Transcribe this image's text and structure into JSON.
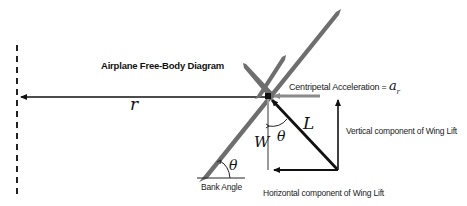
{
  "diagram": {
    "title": "Airplane Free-Body Diagram",
    "labels": {
      "radius": "r",
      "centripetal": "Centripetal Acceleration =",
      "centripetal_symbol": "a",
      "centripetal_subscript": "r",
      "lift": "L",
      "weight": "W",
      "theta_top": "θ",
      "theta_bank": "θ",
      "bank_angle": "Bank Angle",
      "vertical_component": "Vertical component  of Wing Lift",
      "horizontal_component": "Horizontal component  of Wing Lift"
    },
    "colors": {
      "wing": "#6e6e6e",
      "vector": "#111111",
      "gray_vector": "#8a8a8a",
      "background": "#ffffff"
    }
  }
}
